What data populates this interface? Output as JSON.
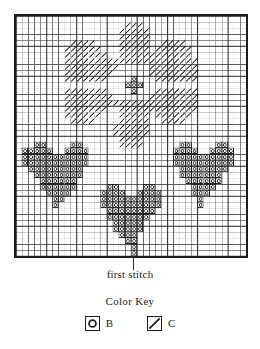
{
  "chart_data": {
    "type": "heatmap",
    "title": "",
    "subtitle": "",
    "xlabel": "",
    "ylabel": "",
    "grid": true,
    "legend_position": "bottom",
    "cols": 38,
    "rows": 40,
    "bold_every": 5,
    "symbols": {
      "B": "circle-in-square",
      "C": "diagonal-slash"
    },
    "colors": {
      "ink": "#1d1d1d",
      "thin_line": "#555555",
      "bold_line": "#1d1d1d",
      "background": "#ffffff"
    },
    "first_stitch": {
      "col": 19,
      "row": 39
    },
    "cells_C": [
      [
        18,
        1
      ],
      [
        19,
        1
      ],
      [
        20,
        1
      ],
      [
        17,
        2
      ],
      [
        18,
        2
      ],
      [
        19,
        2
      ],
      [
        20,
        2
      ],
      [
        21,
        2
      ],
      [
        17,
        3
      ],
      [
        18,
        3
      ],
      [
        19,
        3
      ],
      [
        20,
        3
      ],
      [
        21,
        3
      ],
      [
        9,
        4
      ],
      [
        10,
        4
      ],
      [
        11,
        4
      ],
      [
        12,
        4
      ],
      [
        17,
        4
      ],
      [
        18,
        4
      ],
      [
        19,
        4
      ],
      [
        20,
        4
      ],
      [
        21,
        4
      ],
      [
        24,
        4
      ],
      [
        25,
        4
      ],
      [
        26,
        4
      ],
      [
        27,
        4
      ],
      [
        8,
        5
      ],
      [
        9,
        5
      ],
      [
        10,
        5
      ],
      [
        11,
        5
      ],
      [
        12,
        5
      ],
      [
        13,
        5
      ],
      [
        17,
        5
      ],
      [
        18,
        5
      ],
      [
        19,
        5
      ],
      [
        20,
        5
      ],
      [
        21,
        5
      ],
      [
        23,
        5
      ],
      [
        24,
        5
      ],
      [
        25,
        5
      ],
      [
        26,
        5
      ],
      [
        27,
        5
      ],
      [
        28,
        5
      ],
      [
        8,
        6
      ],
      [
        9,
        6
      ],
      [
        10,
        6
      ],
      [
        11,
        6
      ],
      [
        12,
        6
      ],
      [
        13,
        6
      ],
      [
        14,
        6
      ],
      [
        17,
        6
      ],
      [
        18,
        6
      ],
      [
        19,
        6
      ],
      [
        20,
        6
      ],
      [
        21,
        6
      ],
      [
        22,
        6
      ],
      [
        23,
        6
      ],
      [
        24,
        6
      ],
      [
        25,
        6
      ],
      [
        26,
        6
      ],
      [
        27,
        6
      ],
      [
        28,
        6
      ],
      [
        8,
        7
      ],
      [
        9,
        7
      ],
      [
        10,
        7
      ],
      [
        11,
        7
      ],
      [
        12,
        7
      ],
      [
        13,
        7
      ],
      [
        14,
        7
      ],
      [
        15,
        7
      ],
      [
        16,
        7
      ],
      [
        17,
        7
      ],
      [
        18,
        7
      ],
      [
        19,
        7
      ],
      [
        20,
        7
      ],
      [
        21,
        7
      ],
      [
        22,
        7
      ],
      [
        23,
        7
      ],
      [
        24,
        7
      ],
      [
        25,
        7
      ],
      [
        26,
        7
      ],
      [
        27,
        7
      ],
      [
        28,
        7
      ],
      [
        29,
        7
      ],
      [
        8,
        8
      ],
      [
        9,
        8
      ],
      [
        10,
        8
      ],
      [
        11,
        8
      ],
      [
        12,
        8
      ],
      [
        13,
        8
      ],
      [
        14,
        8
      ],
      [
        15,
        8
      ],
      [
        16,
        8
      ],
      [
        22,
        8
      ],
      [
        23,
        8
      ],
      [
        24,
        8
      ],
      [
        25,
        8
      ],
      [
        26,
        8
      ],
      [
        27,
        8
      ],
      [
        28,
        8
      ],
      [
        29,
        8
      ],
      [
        8,
        9
      ],
      [
        9,
        9
      ],
      [
        10,
        9
      ],
      [
        11,
        9
      ],
      [
        12,
        9
      ],
      [
        13,
        9
      ],
      [
        14,
        9
      ],
      [
        15,
        9
      ],
      [
        22,
        9
      ],
      [
        23,
        9
      ],
      [
        24,
        9
      ],
      [
        25,
        9
      ],
      [
        26,
        9
      ],
      [
        27,
        9
      ],
      [
        28,
        9
      ],
      [
        29,
        9
      ],
      [
        8,
        10
      ],
      [
        9,
        10
      ],
      [
        10,
        10
      ],
      [
        11,
        10
      ],
      [
        12,
        10
      ],
      [
        13,
        10
      ],
      [
        14,
        10
      ],
      [
        23,
        10
      ],
      [
        24,
        10
      ],
      [
        25,
        10
      ],
      [
        26,
        10
      ],
      [
        27,
        10
      ],
      [
        28,
        10
      ],
      [
        29,
        10
      ],
      [
        8,
        12
      ],
      [
        9,
        12
      ],
      [
        10,
        12
      ],
      [
        11,
        12
      ],
      [
        12,
        12
      ],
      [
        13,
        12
      ],
      [
        14,
        12
      ],
      [
        23,
        12
      ],
      [
        24,
        12
      ],
      [
        25,
        12
      ],
      [
        26,
        12
      ],
      [
        27,
        12
      ],
      [
        28,
        12
      ],
      [
        29,
        12
      ],
      [
        8,
        13
      ],
      [
        9,
        13
      ],
      [
        10,
        13
      ],
      [
        11,
        13
      ],
      [
        12,
        13
      ],
      [
        13,
        13
      ],
      [
        14,
        13
      ],
      [
        15,
        13
      ],
      [
        22,
        13
      ],
      [
        23,
        13
      ],
      [
        24,
        13
      ],
      [
        25,
        13
      ],
      [
        26,
        13
      ],
      [
        27,
        13
      ],
      [
        28,
        13
      ],
      [
        29,
        13
      ],
      [
        8,
        14
      ],
      [
        9,
        14
      ],
      [
        10,
        14
      ],
      [
        11,
        14
      ],
      [
        12,
        14
      ],
      [
        13,
        14
      ],
      [
        14,
        14
      ],
      [
        15,
        14
      ],
      [
        16,
        14
      ],
      [
        17,
        14
      ],
      [
        18,
        14
      ],
      [
        19,
        14
      ],
      [
        20,
        14
      ],
      [
        21,
        14
      ],
      [
        22,
        14
      ],
      [
        23,
        14
      ],
      [
        24,
        14
      ],
      [
        25,
        14
      ],
      [
        26,
        14
      ],
      [
        27,
        14
      ],
      [
        28,
        14
      ],
      [
        29,
        14
      ],
      [
        8,
        15
      ],
      [
        9,
        15
      ],
      [
        10,
        15
      ],
      [
        11,
        15
      ],
      [
        12,
        15
      ],
      [
        13,
        15
      ],
      [
        14,
        15
      ],
      [
        17,
        15
      ],
      [
        18,
        15
      ],
      [
        19,
        15
      ],
      [
        20,
        15
      ],
      [
        21,
        15
      ],
      [
        22,
        15
      ],
      [
        23,
        15
      ],
      [
        24,
        15
      ],
      [
        25,
        15
      ],
      [
        26,
        15
      ],
      [
        27,
        15
      ],
      [
        28,
        15
      ],
      [
        29,
        15
      ],
      [
        8,
        16
      ],
      [
        9,
        16
      ],
      [
        10,
        16
      ],
      [
        11,
        16
      ],
      [
        12,
        16
      ],
      [
        13,
        16
      ],
      [
        17,
        16
      ],
      [
        18,
        16
      ],
      [
        19,
        16
      ],
      [
        20,
        16
      ],
      [
        21,
        16
      ],
      [
        23,
        16
      ],
      [
        24,
        16
      ],
      [
        25,
        16
      ],
      [
        26,
        16
      ],
      [
        27,
        16
      ],
      [
        28,
        16
      ],
      [
        9,
        17
      ],
      [
        10,
        17
      ],
      [
        11,
        17
      ],
      [
        12,
        17
      ],
      [
        17,
        17
      ],
      [
        18,
        17
      ],
      [
        19,
        17
      ],
      [
        20,
        17
      ],
      [
        21,
        17
      ],
      [
        24,
        17
      ],
      [
        25,
        17
      ],
      [
        26,
        17
      ],
      [
        27,
        17
      ],
      [
        16,
        18
      ],
      [
        17,
        18
      ],
      [
        18,
        18
      ],
      [
        19,
        18
      ],
      [
        20,
        18
      ],
      [
        21,
        18
      ],
      [
        16,
        19
      ],
      [
        17,
        19
      ],
      [
        18,
        19
      ],
      [
        19,
        19
      ],
      [
        20,
        19
      ],
      [
        21,
        19
      ],
      [
        17,
        20
      ],
      [
        18,
        20
      ],
      [
        19,
        20
      ],
      [
        20,
        20
      ],
      [
        17,
        21
      ],
      [
        18,
        21
      ],
      [
        19,
        21
      ],
      [
        20,
        21
      ]
    ],
    "cells_B": [
      [
        19,
        10
      ],
      [
        18,
        11
      ],
      [
        19,
        11
      ],
      [
        20,
        11
      ],
      [
        19,
        12
      ],
      [
        3,
        21
      ],
      [
        4,
        21
      ],
      [
        9,
        21
      ],
      [
        10,
        21
      ],
      [
        1,
        22
      ],
      [
        2,
        22
      ],
      [
        3,
        22
      ],
      [
        4,
        22
      ],
      [
        5,
        22
      ],
      [
        8,
        22
      ],
      [
        9,
        22
      ],
      [
        10,
        22
      ],
      [
        11,
        22
      ],
      [
        1,
        23
      ],
      [
        2,
        23
      ],
      [
        3,
        23
      ],
      [
        4,
        23
      ],
      [
        5,
        23
      ],
      [
        6,
        23
      ],
      [
        7,
        23
      ],
      [
        8,
        23
      ],
      [
        9,
        23
      ],
      [
        10,
        23
      ],
      [
        11,
        23
      ],
      [
        1,
        24
      ],
      [
        2,
        24
      ],
      [
        3,
        24
      ],
      [
        4,
        24
      ],
      [
        5,
        24
      ],
      [
        6,
        24
      ],
      [
        7,
        24
      ],
      [
        8,
        24
      ],
      [
        9,
        24
      ],
      [
        10,
        24
      ],
      [
        11,
        24
      ],
      [
        2,
        25
      ],
      [
        3,
        25
      ],
      [
        4,
        25
      ],
      [
        5,
        25
      ],
      [
        6,
        25
      ],
      [
        7,
        25
      ],
      [
        8,
        25
      ],
      [
        9,
        25
      ],
      [
        10,
        25
      ],
      [
        3,
        26
      ],
      [
        4,
        26
      ],
      [
        5,
        26
      ],
      [
        6,
        26
      ],
      [
        7,
        26
      ],
      [
        8,
        26
      ],
      [
        9,
        26
      ],
      [
        10,
        26
      ],
      [
        4,
        27
      ],
      [
        5,
        27
      ],
      [
        6,
        27
      ],
      [
        7,
        27
      ],
      [
        8,
        27
      ],
      [
        9,
        27
      ],
      [
        4,
        28
      ],
      [
        5,
        28
      ],
      [
        6,
        28
      ],
      [
        7,
        28
      ],
      [
        8,
        28
      ],
      [
        9,
        28
      ],
      [
        5,
        29
      ],
      [
        6,
        29
      ],
      [
        7,
        29
      ],
      [
        8,
        29
      ],
      [
        6,
        30
      ],
      [
        7,
        30
      ],
      [
        6,
        31
      ],
      [
        27,
        21
      ],
      [
        28,
        21
      ],
      [
        33,
        21
      ],
      [
        34,
        21
      ],
      [
        26,
        22
      ],
      [
        27,
        22
      ],
      [
        28,
        22
      ],
      [
        29,
        22
      ],
      [
        32,
        22
      ],
      [
        33,
        22
      ],
      [
        34,
        22
      ],
      [
        35,
        22
      ],
      [
        26,
        23
      ],
      [
        27,
        23
      ],
      [
        28,
        23
      ],
      [
        29,
        23
      ],
      [
        30,
        23
      ],
      [
        31,
        23
      ],
      [
        32,
        23
      ],
      [
        33,
        23
      ],
      [
        34,
        23
      ],
      [
        35,
        23
      ],
      [
        26,
        24
      ],
      [
        27,
        24
      ],
      [
        28,
        24
      ],
      [
        29,
        24
      ],
      [
        30,
        24
      ],
      [
        31,
        24
      ],
      [
        32,
        24
      ],
      [
        33,
        24
      ],
      [
        34,
        24
      ],
      [
        35,
        24
      ],
      [
        27,
        25
      ],
      [
        28,
        25
      ],
      [
        29,
        25
      ],
      [
        30,
        25
      ],
      [
        31,
        25
      ],
      [
        32,
        25
      ],
      [
        33,
        25
      ],
      [
        34,
        25
      ],
      [
        27,
        26
      ],
      [
        28,
        26
      ],
      [
        29,
        26
      ],
      [
        30,
        26
      ],
      [
        31,
        26
      ],
      [
        32,
        26
      ],
      [
        33,
        26
      ],
      [
        28,
        27
      ],
      [
        29,
        27
      ],
      [
        30,
        27
      ],
      [
        31,
        27
      ],
      [
        32,
        27
      ],
      [
        33,
        27
      ],
      [
        29,
        28
      ],
      [
        30,
        28
      ],
      [
        31,
        28
      ],
      [
        32,
        28
      ],
      [
        29,
        29
      ],
      [
        30,
        29
      ],
      [
        31,
        29
      ],
      [
        30,
        30
      ],
      [
        30,
        31
      ],
      [
        15,
        28
      ],
      [
        16,
        28
      ],
      [
        21,
        28
      ],
      [
        22,
        28
      ],
      [
        14,
        29
      ],
      [
        15,
        29
      ],
      [
        16,
        29
      ],
      [
        17,
        29
      ],
      [
        20,
        29
      ],
      [
        21,
        29
      ],
      [
        22,
        29
      ],
      [
        23,
        29
      ],
      [
        14,
        30
      ],
      [
        15,
        30
      ],
      [
        16,
        30
      ],
      [
        17,
        30
      ],
      [
        18,
        30
      ],
      [
        19,
        30
      ],
      [
        20,
        30
      ],
      [
        21,
        30
      ],
      [
        22,
        30
      ],
      [
        23,
        30
      ],
      [
        14,
        31
      ],
      [
        15,
        31
      ],
      [
        16,
        31
      ],
      [
        17,
        31
      ],
      [
        18,
        31
      ],
      [
        19,
        31
      ],
      [
        20,
        31
      ],
      [
        21,
        31
      ],
      [
        22,
        31
      ],
      [
        23,
        31
      ],
      [
        15,
        32
      ],
      [
        16,
        32
      ],
      [
        17,
        32
      ],
      [
        18,
        32
      ],
      [
        19,
        32
      ],
      [
        20,
        32
      ],
      [
        21,
        32
      ],
      [
        22,
        32
      ],
      [
        15,
        33
      ],
      [
        16,
        33
      ],
      [
        17,
        33
      ],
      [
        18,
        33
      ],
      [
        19,
        33
      ],
      [
        20,
        33
      ],
      [
        21,
        33
      ],
      [
        16,
        34
      ],
      [
        17,
        34
      ],
      [
        18,
        34
      ],
      [
        19,
        34
      ],
      [
        20,
        34
      ],
      [
        16,
        35
      ],
      [
        17,
        35
      ],
      [
        18,
        35
      ],
      [
        19,
        35
      ],
      [
        20,
        35
      ],
      [
        17,
        36
      ],
      [
        18,
        36
      ],
      [
        19,
        36
      ],
      [
        18,
        37
      ],
      [
        19,
        37
      ],
      [
        19,
        38
      ],
      [
        19,
        39
      ]
    ]
  },
  "annotations": {
    "first_stitch_label": "first stitch"
  },
  "color_key": {
    "title": "Color Key",
    "entries": [
      {
        "symbol": "circle-in-square",
        "label": "B"
      },
      {
        "symbol": "diagonal-slash",
        "label": "C"
      }
    ]
  }
}
